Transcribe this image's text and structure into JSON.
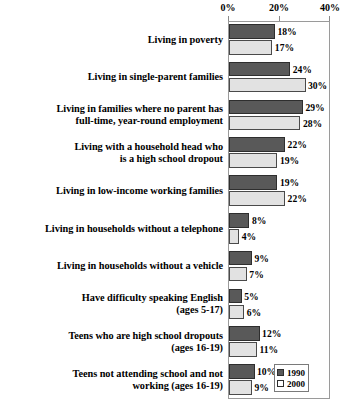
{
  "chart_data": {
    "type": "bar",
    "orientation": "horizontal",
    "title": "",
    "xlabel": "",
    "ylabel": "",
    "xlim": [
      0,
      40
    ],
    "xticks": [
      0,
      20,
      40
    ],
    "xtick_labels": [
      "0%",
      "20%",
      "40%"
    ],
    "grid": false,
    "legend_position": "bottom-right",
    "categories": [
      "Living in poverty",
      "Living in single-parent families",
      "Living in families where no parent has full-time, year-round employment",
      "Living with a household head who is a high school dropout",
      "Living in low-income working families",
      "Living in households without a telephone",
      "Living in households without a vehicle",
      "Have difficulty speaking English (ages 5-17)",
      "Teens who are high school dropouts (ages 16-19)",
      "Teens not attending school and not working (ages 16-19)"
    ],
    "series": [
      {
        "name": "1990",
        "color": "#595959",
        "values": [
          18,
          24,
          29,
          22,
          19,
          8,
          9,
          5,
          12,
          10
        ],
        "value_labels": [
          "18%",
          "24%",
          "29%",
          "22%",
          "19%",
          "8%",
          "9%",
          "5%",
          "12%",
          "10%"
        ]
      },
      {
        "name": "2000",
        "color": "#e2e2e2",
        "values": [
          17,
          30,
          28,
          19,
          22,
          4,
          7,
          6,
          11,
          9
        ],
        "value_labels": [
          "17%",
          "30%",
          "28%",
          "19%",
          "22%",
          "4%",
          "7%",
          "6%",
          "11%",
          "9%"
        ]
      }
    ]
  },
  "axis": {
    "ticks": [
      {
        "label": "0%",
        "value": 0
      },
      {
        "label": "20%",
        "value": 20
      },
      {
        "label": "40%",
        "value": 40
      }
    ]
  },
  "rows": [
    {
      "label_lines": [
        "Living in poverty"
      ],
      "v1990": 18,
      "l1990": "18%",
      "v2000": 17,
      "l2000": "17%"
    },
    {
      "label_lines": [
        "Living in single-parent families"
      ],
      "v1990": 24,
      "l1990": "24%",
      "v2000": 30,
      "l2000": "30%"
    },
    {
      "label_lines": [
        "Living in families where no parent has",
        "full-time, year-round employment"
      ],
      "v1990": 29,
      "l1990": "29%",
      "v2000": 28,
      "l2000": "28%"
    },
    {
      "label_lines": [
        "Living with a household head who",
        "is a high school dropout"
      ],
      "v1990": 22,
      "l1990": "22%",
      "v2000": 19,
      "l2000": "19%"
    },
    {
      "label_lines": [
        "Living in low-income working families"
      ],
      "v1990": 19,
      "l1990": "19%",
      "v2000": 22,
      "l2000": "22%"
    },
    {
      "label_lines": [
        "Living in households without a telephone"
      ],
      "v1990": 8,
      "l1990": "8%",
      "v2000": 4,
      "l2000": "4%"
    },
    {
      "label_lines": [
        "Living in households without a vehicle"
      ],
      "v1990": 9,
      "l1990": "9%",
      "v2000": 7,
      "l2000": "7%"
    },
    {
      "label_lines": [
        "Have difficulty speaking English",
        "(ages 5-17)"
      ],
      "v1990": 5,
      "l1990": "5%",
      "v2000": 6,
      "l2000": "6%"
    },
    {
      "label_lines": [
        "Teens who are high school dropouts",
        "(ages 16-19)"
      ],
      "v1990": 12,
      "l1990": "12%",
      "v2000": 11,
      "l2000": "11%"
    },
    {
      "label_lines": [
        "Teens not attending school and not",
        "working (ages 16-19)"
      ],
      "v1990": 10,
      "l1990": "10%",
      "v2000": 9,
      "l2000": "9%"
    }
  ],
  "legend": {
    "items": [
      {
        "label": "1990",
        "color": "#595959"
      },
      {
        "label": "2000",
        "color": "#ffffff"
      }
    ]
  }
}
